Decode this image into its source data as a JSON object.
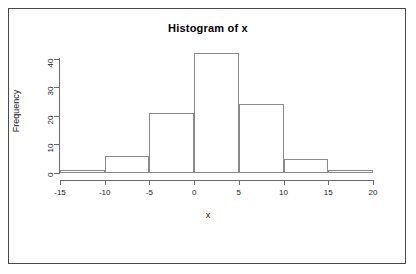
{
  "window": {
    "background_color": "#ffffff",
    "frame_color": "#4a4a4a"
  },
  "chart_data": {
    "type": "bar",
    "title": "Histogram of x",
    "xlabel": "x",
    "ylabel": "Frequency",
    "categories": [
      "[-15,-10)",
      "[-10,-5)",
      "[-5,0)",
      "[0,5)",
      "[5,10)",
      "[10,15)",
      "[15,20)"
    ],
    "bin_edges": [
      -15,
      -10,
      -5,
      0,
      5,
      10,
      15,
      20
    ],
    "values": [
      1,
      6,
      21,
      42,
      24,
      5,
      1
    ],
    "xlim": [
      -15,
      20
    ],
    "ylim": [
      0,
      44
    ],
    "x_ticks": [
      -15,
      -10,
      -5,
      0,
      5,
      10,
      15,
      20
    ],
    "x_tick_labels": [
      "-15",
      "-10",
      "-5",
      "0",
      "5",
      "10",
      "15",
      "20"
    ],
    "y_ticks": [
      0,
      10,
      20,
      30,
      40
    ],
    "y_tick_labels": [
      "0",
      "10",
      "20",
      "30",
      "40"
    ],
    "grid": false,
    "legend": null,
    "bar_border_color": "#8a8a8a",
    "bar_fill_color": "transparent",
    "axis_color": "#6b6b6b"
  }
}
